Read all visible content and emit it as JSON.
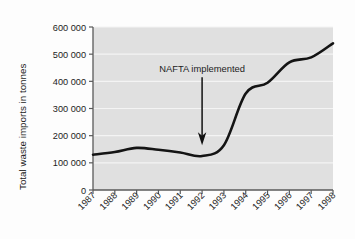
{
  "chart_data": {
    "type": "line",
    "title": "",
    "xlabel": "",
    "ylabel": "Total waste imports in tonnes",
    "categories": [
      "1987",
      "1988",
      "1989",
      "1990",
      "1991",
      "1992",
      "1993",
      "1994",
      "1995",
      "1996",
      "1997",
      "1998"
    ],
    "x": [
      1987,
      1988,
      1989,
      1990,
      1991,
      1992,
      1993,
      1994,
      1995,
      1996,
      1997,
      1998
    ],
    "values": [
      130000,
      140000,
      155000,
      148000,
      138000,
      125000,
      165000,
      355000,
      395000,
      470000,
      488000,
      540000
    ],
    "series": [
      {
        "name": "Total waste imports",
        "values": [
          130000,
          140000,
          155000,
          148000,
          138000,
          125000,
          165000,
          355000,
          395000,
          470000,
          488000,
          540000
        ]
      }
    ],
    "ylim": [
      0,
      600000
    ],
    "yticks": [
      0,
      100000,
      200000,
      300000,
      400000,
      500000,
      600000
    ],
    "ytick_labels": [
      "0",
      "100 000",
      "200 000",
      "300 000",
      "400 000",
      "500 000",
      "600 000"
    ],
    "xtick_labels": [
      "1987",
      "1988",
      "1989",
      "1990",
      "1991",
      "1992",
      "1993",
      "1994",
      "1995",
      "1996",
      "1997",
      "1998"
    ],
    "xtick_rotation": 45,
    "grid": "horizontal-white",
    "legend": "none",
    "annotations": [
      {
        "text": "NAFTA implemented",
        "type": "arrow-down",
        "at_x": "1992",
        "at_y": 165000,
        "label_y": 415000
      }
    ],
    "plot_background": "#e0e0e0",
    "line_color": "#141414",
    "gridline_color": "#f2f2f2",
    "axis_color": "#555555"
  },
  "annotation": {
    "nafta_label": "NAFTA implemented"
  },
  "yaxis": {
    "title": "Total waste imports in tonnes",
    "ticks": [
      "600 000",
      "500 000",
      "400 000",
      "300 000",
      "200 000",
      "100 000",
      "0"
    ]
  },
  "xaxis": {
    "ticks": [
      "1987",
      "1988",
      "1989",
      "1990",
      "1991",
      "1992",
      "1993",
      "1994",
      "1995",
      "1996",
      "1997",
      "1998"
    ]
  }
}
